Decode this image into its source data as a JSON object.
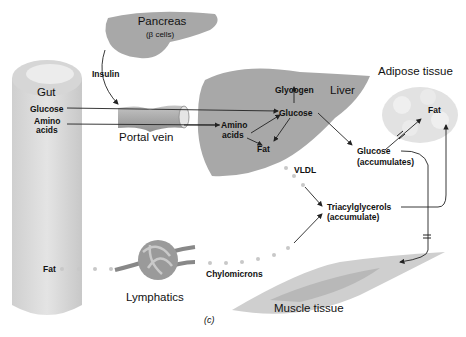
{
  "organs": {
    "pancreas": {
      "name": "Pancreas",
      "sub": "(β cells)"
    },
    "gut": "Gut",
    "liver": "Liver",
    "adipose": "Adipose tissue",
    "portal_vein": "Portal vein",
    "lymphatics": "Lymphatics",
    "muscle": "Muscle tissue"
  },
  "labels": {
    "insulin": "Insulin",
    "gut_glucose": "Glucose",
    "gut_amino_1": "Amino",
    "gut_amino_2": "acids",
    "liver_glycogen": "Glycogen",
    "liver_glucose": "Glucose",
    "liver_amino_1": "Amino",
    "liver_amino_2": "acids",
    "liver_fat": "Fat",
    "blood_glucose_1": "Glucose",
    "blood_glucose_2": "(accumulates)",
    "adipose_fat": "Fat",
    "vldl": "VLDL",
    "tg_1": "Triacylglycerols",
    "tg_2": "(accumulate)",
    "gut_fat": "Fat",
    "chylomicrons": "Chylomicrons",
    "panel": "(c)"
  },
  "colors": {
    "organ_gray": "#a8a8a8",
    "light_gray": "#d9d9d9",
    "arrow": "#222222"
  }
}
